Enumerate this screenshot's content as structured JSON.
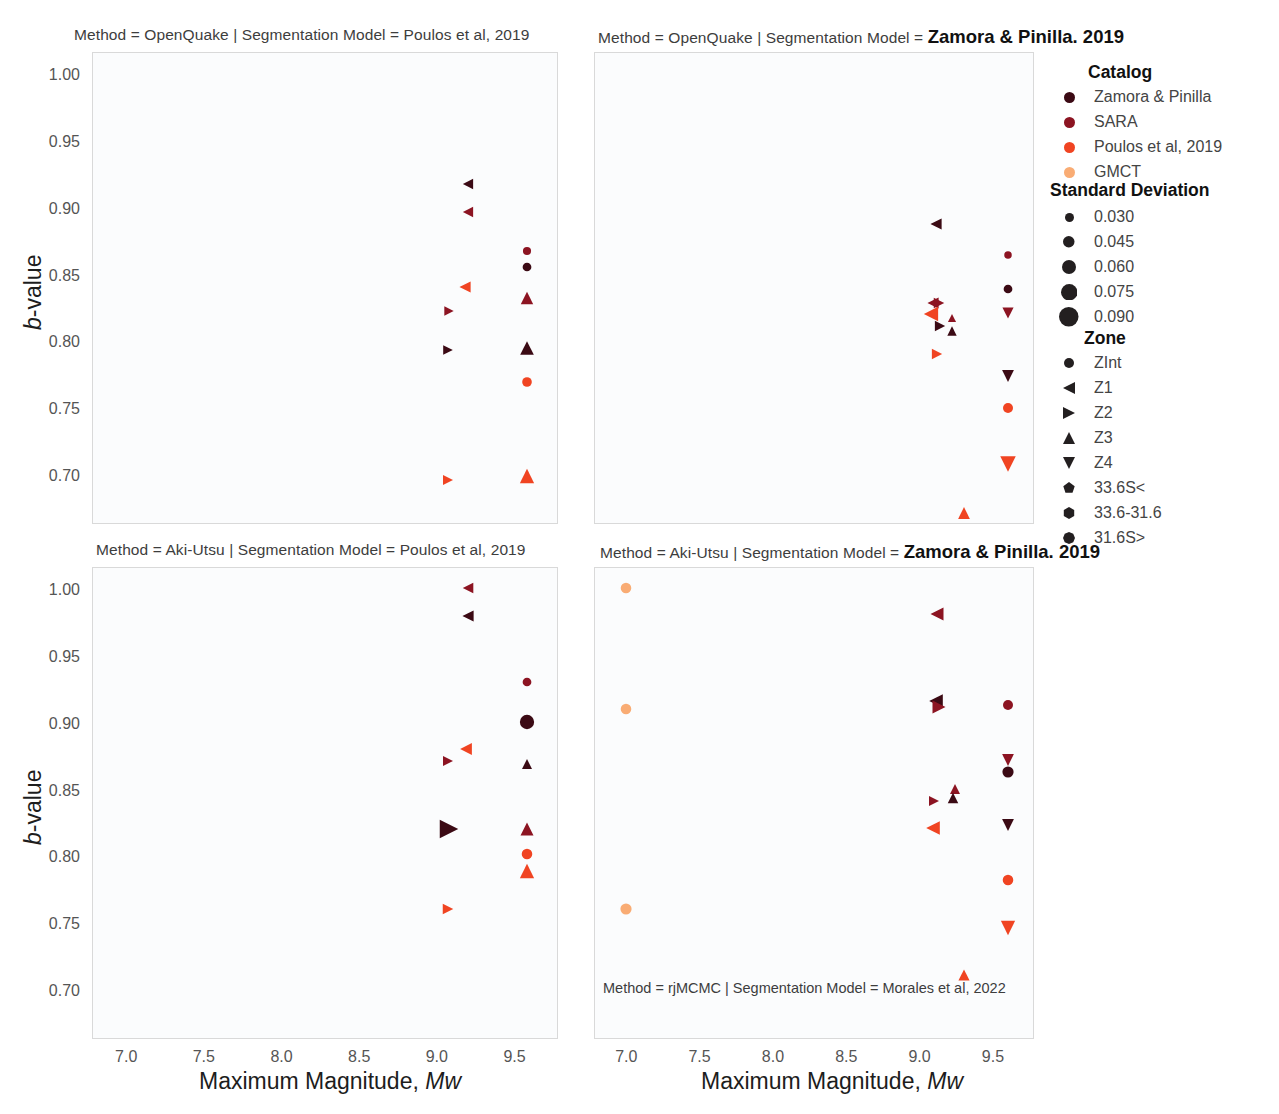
{
  "figure": {
    "width": 1279,
    "height": 1114,
    "background": "#ffffff",
    "panel_background": "#fbfcfd",
    "panel_border": "#d9d9d9"
  },
  "axes": {
    "x_label_prefix": "Maximum Magnitude, ",
    "x_label_italic": "Mw",
    "y_label_italic": "b",
    "y_label_rest": "-value",
    "xlim": [
      6.78,
      9.78
    ],
    "ylim": [
      0.665,
      1.018
    ],
    "xticks": [
      "7.0",
      "7.5",
      "8.0",
      "8.5",
      "9.0",
      "9.5"
    ],
    "xtick_values": [
      7.0,
      7.5,
      8.0,
      8.5,
      9.0,
      9.5
    ],
    "yticks": [
      "1.00",
      "0.95",
      "0.90",
      "0.85",
      "0.80",
      "0.75",
      "0.70"
    ],
    "ytick_values": [
      1.0,
      0.95,
      0.9,
      0.85,
      0.8,
      0.75,
      0.7
    ]
  },
  "panels": [
    {
      "id": "top-left",
      "title_prefix": "Method = OpenQuake | Segmentation Model = Poulos et al, 2019",
      "title_emph": ""
    },
    {
      "id": "top-right",
      "title_prefix": "Method = OpenQuake | Segmentation Model = ",
      "title_emph": "Zamora & Pinilla. 2019"
    },
    {
      "id": "bottom-left",
      "title_prefix": "Method = Aki-Utsu | Segmentation Model = Poulos et al, 2019",
      "title_emph": ""
    },
    {
      "id": "bottom-right",
      "title_prefix": "Method = Aki-Utsu | Segmentation Model = ",
      "title_emph": "Zamora & Pinilla. 2019",
      "inner_note": "Method = rjMCMC | Segmentation Model = Morales et al, 2022"
    }
  ],
  "legend": {
    "catalog": {
      "title": "Catalog",
      "items": [
        {
          "label": "Zamora & Pinilla",
          "color": "#3b0a14"
        },
        {
          "label": "SARA",
          "color": "#8c1422"
        },
        {
          "label": "Poulos et al, 2019",
          "color": "#f04422"
        },
        {
          "label": "GMCT",
          "color": "#f9ac74"
        }
      ]
    },
    "standard_deviation": {
      "title": "Standard Deviation",
      "items": [
        {
          "label": "0.030",
          "size": 9
        },
        {
          "label": "0.045",
          "size": 11.5
        },
        {
          "label": "0.060",
          "size": 14
        },
        {
          "label": "0.075",
          "size": 16.5
        },
        {
          "label": "0.090",
          "size": 19.5
        }
      ],
      "color": "#231f20"
    },
    "zone": {
      "title": "Zone",
      "items": [
        {
          "label": "ZInt",
          "shape": "circle"
        },
        {
          "label": "Z1",
          "shape": "triangle-left"
        },
        {
          "label": "Z2",
          "shape": "triangle-right"
        },
        {
          "label": "Z3",
          "shape": "triangle-up"
        },
        {
          "label": "Z4",
          "shape": "triangle-down"
        },
        {
          "label": "33.6S<",
          "shape": "pentagon"
        },
        {
          "label": "33.6-31.6",
          "shape": "hexagon"
        },
        {
          "label": "31.6S>",
          "shape": "octagon"
        }
      ],
      "color": "#231f20"
    }
  },
  "chart_data": {
    "type": "scatter",
    "xlabel": "Maximum Magnitude, Mw",
    "ylabel": "b-value",
    "xlim": [
      6.78,
      9.78
    ],
    "ylim": [
      0.665,
      1.018
    ],
    "grid": false,
    "legend_position": "right",
    "encodings": {
      "color": "Catalog",
      "size": "Standard Deviation",
      "shape": "Zone"
    },
    "facets": [
      {
        "row": "Method",
        "col": "Segmentation Model",
        "panel": "top-left",
        "method": "OpenQuake",
        "segmentation_model": "Poulos et al, 2019",
        "points": [
          {
            "x": 9.2,
            "y": 0.919,
            "catalog": "Zamora & Pinilla",
            "zone": "Z1",
            "sd": 0.035
          },
          {
            "x": 9.2,
            "y": 0.898,
            "catalog": "SARA",
            "zone": "Z1",
            "sd": 0.035
          },
          {
            "x": 9.58,
            "y": 0.869,
            "catalog": "SARA",
            "zone": "ZInt",
            "sd": 0.028
          },
          {
            "x": 9.58,
            "y": 0.857,
            "catalog": "Zamora & Pinilla",
            "zone": "ZInt",
            "sd": 0.03
          },
          {
            "x": 9.18,
            "y": 0.842,
            "catalog": "Poulos et al, 2019",
            "zone": "Z1",
            "sd": 0.038
          },
          {
            "x": 9.58,
            "y": 0.834,
            "catalog": "SARA",
            "zone": "Z3",
            "sd": 0.042
          },
          {
            "x": 9.08,
            "y": 0.824,
            "catalog": "SARA",
            "zone": "Z2",
            "sd": 0.032
          },
          {
            "x": 9.07,
            "y": 0.795,
            "catalog": "Zamora & Pinilla",
            "zone": "Z2",
            "sd": 0.033
          },
          {
            "x": 9.58,
            "y": 0.797,
            "catalog": "Zamora & Pinilla",
            "zone": "Z3",
            "sd": 0.046
          },
          {
            "x": 9.58,
            "y": 0.771,
            "catalog": "Poulos et al, 2019",
            "zone": "ZInt",
            "sd": 0.033
          },
          {
            "x": 9.07,
            "y": 0.698,
            "catalog": "Poulos et al, 2019",
            "zone": "Z2",
            "sd": 0.034
          },
          {
            "x": 9.58,
            "y": 0.701,
            "catalog": "Poulos et al, 2019",
            "zone": "Z3",
            "sd": 0.048
          }
        ]
      },
      {
        "row": "Method",
        "col": "Segmentation Model",
        "panel": "top-right",
        "method": "OpenQuake",
        "segmentation_model": "Zamora & Pinilla. 2019",
        "points": [
          {
            "x": 9.11,
            "y": 0.889,
            "catalog": "Zamora & Pinilla",
            "zone": "Z1",
            "sd": 0.038
          },
          {
            "x": 9.6,
            "y": 0.866,
            "catalog": "SARA",
            "zone": "ZInt",
            "sd": 0.026
          },
          {
            "x": 9.6,
            "y": 0.841,
            "catalog": "Zamora & Pinilla",
            "zone": "ZInt",
            "sd": 0.03
          },
          {
            "x": 9.09,
            "y": 0.83,
            "catalog": "SARA",
            "zone": "Z1",
            "sd": 0.038
          },
          {
            "x": 9.13,
            "y": 0.83,
            "catalog": "SARA",
            "zone": "Z2",
            "sd": 0.036
          },
          {
            "x": 9.6,
            "y": 0.823,
            "catalog": "SARA",
            "zone": "Z4",
            "sd": 0.038
          },
          {
            "x": 9.08,
            "y": 0.822,
            "catalog": "Poulos et al, 2019",
            "zone": "Z1",
            "sd": 0.048
          },
          {
            "x": 9.14,
            "y": 0.813,
            "catalog": "Zamora & Pinilla",
            "zone": "Z2",
            "sd": 0.035
          },
          {
            "x": 9.22,
            "y": 0.819,
            "catalog": "SARA",
            "zone": "Z3",
            "sd": 0.028
          },
          {
            "x": 9.22,
            "y": 0.809,
            "catalog": "Zamora & Pinilla",
            "zone": "Z3",
            "sd": 0.032
          },
          {
            "x": 9.12,
            "y": 0.792,
            "catalog": "Poulos et al, 2019",
            "zone": "Z2",
            "sd": 0.035
          },
          {
            "x": 9.6,
            "y": 0.776,
            "catalog": "Zamora & Pinilla",
            "zone": "Z4",
            "sd": 0.04
          },
          {
            "x": 9.6,
            "y": 0.752,
            "catalog": "Poulos et al, 2019",
            "zone": "ZInt",
            "sd": 0.034
          },
          {
            "x": 9.6,
            "y": 0.71,
            "catalog": "Poulos et al, 2019",
            "zone": "Z4",
            "sd": 0.052
          },
          {
            "x": 9.3,
            "y": 0.673,
            "catalog": "Poulos et al, 2019",
            "zone": "Z3",
            "sd": 0.04
          }
        ]
      },
      {
        "row": "Method",
        "col": "Segmentation Model",
        "panel": "bottom-left",
        "method": "Aki-Utsu",
        "segmentation_model": "Poulos et al, 2019",
        "points": [
          {
            "x": 9.2,
            "y": 1.002,
            "catalog": "SARA",
            "zone": "Z1",
            "sd": 0.036
          },
          {
            "x": 9.2,
            "y": 0.981,
            "catalog": "Zamora & Pinilla",
            "zone": "Z1",
            "sd": 0.038
          },
          {
            "x": 9.58,
            "y": 0.932,
            "catalog": "SARA",
            "zone": "ZInt",
            "sd": 0.03
          },
          {
            "x": 9.58,
            "y": 0.902,
            "catalog": "Zamora & Pinilla",
            "zone": "ZInt",
            "sd": 0.048
          },
          {
            "x": 9.19,
            "y": 0.882,
            "catalog": "Poulos et al, 2019",
            "zone": "Z1",
            "sd": 0.04
          },
          {
            "x": 9.07,
            "y": 0.873,
            "catalog": "SARA",
            "zone": "Z2",
            "sd": 0.034
          },
          {
            "x": 9.58,
            "y": 0.871,
            "catalog": "Zamora & Pinilla",
            "zone": "Z3",
            "sd": 0.034
          },
          {
            "x": 9.08,
            "y": 0.822,
            "catalog": "Zamora & Pinilla",
            "zone": "Z2",
            "sd": 0.062
          },
          {
            "x": 9.58,
            "y": 0.822,
            "catalog": "SARA",
            "zone": "Z3",
            "sd": 0.044
          },
          {
            "x": 9.58,
            "y": 0.803,
            "catalog": "Poulos et al, 2019",
            "zone": "ZInt",
            "sd": 0.036
          },
          {
            "x": 9.58,
            "y": 0.791,
            "catalog": "Poulos et al, 2019",
            "zone": "Z3",
            "sd": 0.048
          },
          {
            "x": 9.07,
            "y": 0.762,
            "catalog": "Poulos et al, 2019",
            "zone": "Z2",
            "sd": 0.036
          }
        ]
      },
      {
        "row": "Method",
        "col": "Segmentation Model",
        "panel": "bottom-right",
        "method": "Aki-Utsu",
        "segmentation_model": "Zamora & Pinilla. 2019",
        "points": [
          {
            "x": 7.0,
            "y": 1.002,
            "catalog": "GMCT",
            "zone": "ZInt",
            "sd": 0.036
          },
          {
            "x": 9.12,
            "y": 0.983,
            "catalog": "SARA",
            "zone": "Z1",
            "sd": 0.044
          },
          {
            "x": 9.11,
            "y": 0.918,
            "catalog": "Zamora & Pinilla",
            "zone": "Z1",
            "sd": 0.046
          },
          {
            "x": 9.13,
            "y": 0.913,
            "catalog": "SARA",
            "zone": "Z2",
            "sd": 0.044
          },
          {
            "x": 7.0,
            "y": 0.912,
            "catalog": "GMCT",
            "zone": "ZInt",
            "sd": 0.036
          },
          {
            "x": 9.6,
            "y": 0.915,
            "catalog": "SARA",
            "zone": "ZInt",
            "sd": 0.034
          },
          {
            "x": 9.6,
            "y": 0.874,
            "catalog": "SARA",
            "zone": "Z4",
            "sd": 0.04
          },
          {
            "x": 9.6,
            "y": 0.865,
            "catalog": "Zamora & Pinilla",
            "zone": "ZInt",
            "sd": 0.038
          },
          {
            "x": 9.24,
            "y": 0.852,
            "catalog": "SARA",
            "zone": "Z3",
            "sd": 0.034
          },
          {
            "x": 9.23,
            "y": 0.845,
            "catalog": "Zamora & Pinilla",
            "zone": "Z3",
            "sd": 0.036
          },
          {
            "x": 9.1,
            "y": 0.843,
            "catalog": "SARA",
            "zone": "Z2",
            "sd": 0.034
          },
          {
            "x": 9.6,
            "y": 0.825,
            "catalog": "Zamora & Pinilla",
            "zone": "Z4",
            "sd": 0.04
          },
          {
            "x": 9.09,
            "y": 0.823,
            "catalog": "Poulos et al, 2019",
            "zone": "Z1",
            "sd": 0.046
          },
          {
            "x": 7.0,
            "y": 0.762,
            "catalog": "GMCT",
            "zone": "ZInt",
            "sd": 0.038
          },
          {
            "x": 9.6,
            "y": 0.784,
            "catalog": "Poulos et al, 2019",
            "zone": "ZInt",
            "sd": 0.036
          },
          {
            "x": 9.6,
            "y": 0.748,
            "catalog": "Poulos et al, 2019",
            "zone": "Z4",
            "sd": 0.048
          },
          {
            "x": 9.3,
            "y": 0.713,
            "catalog": "Poulos et al, 2019",
            "zone": "Z3",
            "sd": 0.038
          }
        ]
      }
    ]
  }
}
